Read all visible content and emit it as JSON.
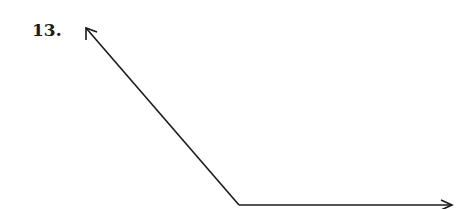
{
  "problem": {
    "number_label": "13."
  },
  "figure": {
    "type": "angle",
    "vertex": [
      239,
      205
    ],
    "ray1_tip": [
      85,
      27
    ],
    "ray2_tip": [
      452,
      205
    ],
    "stroke_color": "#1a1a1a"
  }
}
